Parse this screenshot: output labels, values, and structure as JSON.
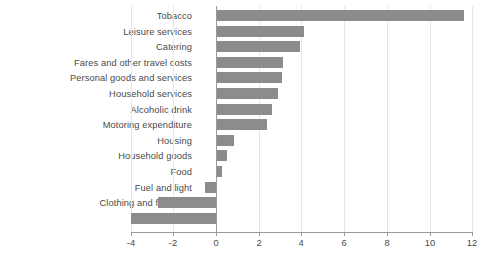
{
  "chart_data": {
    "type": "bar",
    "orientation": "horizontal",
    "title": "",
    "subtitle": "",
    "xlabel": "",
    "ylabel": "",
    "xlim": [
      -4,
      12
    ],
    "xticks": [
      -4,
      -2,
      0,
      2,
      4,
      6,
      8,
      10,
      12
    ],
    "xtick_labels": [
      "-4",
      "-2",
      "0",
      "2",
      "4",
      "6",
      "8",
      "10",
      "12"
    ],
    "grid": true,
    "grid_axis": "x",
    "legend": false,
    "legend_position": "none",
    "zero_line": true,
    "bar_color": "#8c8c8c",
    "text_color": "#4a4a4a",
    "grid_color": "#e6e6e6",
    "axis_color": "#9a9a9a",
    "background": "#ffffff",
    "categories": [
      "Tobacco",
      "Leisure services",
      "Catering",
      "Fares and other travel costs",
      "Personal goods and services",
      "Household services",
      "Alcoholic drink",
      "Motoring expenditure",
      "Housing",
      "Household goods",
      "Food",
      "Fuel and light",
      "Clothing and footwear",
      "Leisure goods"
    ],
    "values": [
      11.6,
      4.1,
      3.95,
      3.15,
      3.1,
      2.9,
      2.6,
      2.4,
      0.85,
      0.5,
      0.3,
      -0.5,
      -2.7,
      -4.0
    ]
  }
}
